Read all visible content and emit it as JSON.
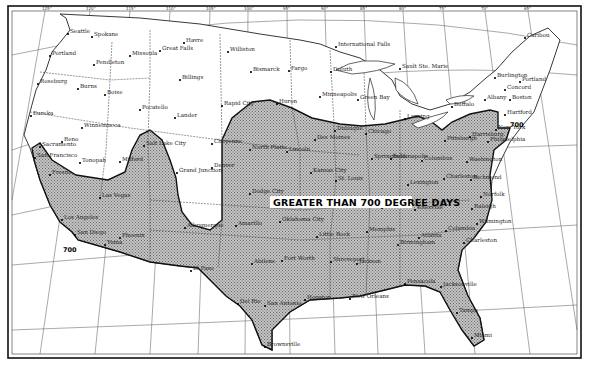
{
  "map": {
    "title_label": "GREATER THAN 700 DEGREE DAYS",
    "isoline_value": "700",
    "isoline_label_west": "700",
    "isoline_label_east": "700",
    "colors": {
      "background": "#ffffff",
      "land_shaded": "#b8b8b8",
      "border": "#111111",
      "graticule": "#444444"
    },
    "longitude_ticks": [
      "125°",
      "120°",
      "115°",
      "110°",
      "105°",
      "100°",
      "95°",
      "90°",
      "85°",
      "80°",
      "75°",
      "70°",
      "65°"
    ],
    "latitude_ticks": [
      "45°",
      "40°",
      "35°",
      "30°",
      "25°"
    ],
    "lakes": [
      "Lake Superior",
      "Lake Michigan",
      "Lake Huron",
      "Lake Erie",
      "Lake Ontario"
    ],
    "cities": [
      {
        "name": "Seattle",
        "x": 68,
        "y": 34
      },
      {
        "name": "Spokane",
        "x": 92,
        "y": 37
      },
      {
        "name": "Portland",
        "x": 50,
        "y": 56
      },
      {
        "name": "Pendleton",
        "x": 94,
        "y": 65
      },
      {
        "name": "Missoula",
        "x": 130,
        "y": 56
      },
      {
        "name": "Great Falls",
        "x": 160,
        "y": 51
      },
      {
        "name": "Havre",
        "x": 184,
        "y": 43
      },
      {
        "name": "Williston",
        "x": 228,
        "y": 52
      },
      {
        "name": "Bismarck",
        "x": 251,
        "y": 72
      },
      {
        "name": "Fargo",
        "x": 289,
        "y": 71
      },
      {
        "name": "International Falls",
        "x": 336,
        "y": 47
      },
      {
        "name": "Duluth",
        "x": 331,
        "y": 72
      },
      {
        "name": "Sault Ste. Marie",
        "x": 400,
        "y": 69
      },
      {
        "name": "Roseburg",
        "x": 38,
        "y": 84
      },
      {
        "name": "Burns",
        "x": 78,
        "y": 89
      },
      {
        "name": "Boise",
        "x": 105,
        "y": 95
      },
      {
        "name": "Billings",
        "x": 180,
        "y": 80
      },
      {
        "name": "Minneapolis",
        "x": 320,
        "y": 97
      },
      {
        "name": "Green Bay",
        "x": 358,
        "y": 100
      },
      {
        "name": "Burlington",
        "x": 495,
        "y": 78
      },
      {
        "name": "Portland",
        "x": 520,
        "y": 82
      },
      {
        "name": "Caribou",
        "x": 525,
        "y": 38
      },
      {
        "name": "Concord",
        "x": 505,
        "y": 90
      },
      {
        "name": "Albany",
        "x": 485,
        "y": 100
      },
      {
        "name": "Boston",
        "x": 510,
        "y": 100
      },
      {
        "name": "Buffalo",
        "x": 452,
        "y": 107
      },
      {
        "name": "Eureka",
        "x": 31,
        "y": 116
      },
      {
        "name": "Winnemucca",
        "x": 82,
        "y": 128
      },
      {
        "name": "Pocatello",
        "x": 140,
        "y": 110
      },
      {
        "name": "Lander",
        "x": 175,
        "y": 118
      },
      {
        "name": "Rapid City",
        "x": 222,
        "y": 106
      },
      {
        "name": "Huron",
        "x": 277,
        "y": 104
      },
      {
        "name": "Lansing",
        "x": 405,
        "y": 119
      },
      {
        "name": "Hartford",
        "x": 505,
        "y": 115
      },
      {
        "name": "New York",
        "x": 496,
        "y": 130
      },
      {
        "name": "Reno",
        "x": 62,
        "y": 142
      },
      {
        "name": "Salt Lake City",
        "x": 144,
        "y": 146
      },
      {
        "name": "Cheyenne",
        "x": 212,
        "y": 144
      },
      {
        "name": "North Platte",
        "x": 250,
        "y": 150
      },
      {
        "name": "Lincoln",
        "x": 287,
        "y": 152
      },
      {
        "name": "Des Moines",
        "x": 315,
        "y": 140
      },
      {
        "name": "Dubuque",
        "x": 335,
        "y": 131
      },
      {
        "name": "Chicago",
        "x": 366,
        "y": 134
      },
      {
        "name": "Pittsburgh",
        "x": 445,
        "y": 141
      },
      {
        "name": "Harrisburg",
        "x": 470,
        "y": 137
      },
      {
        "name": "Philadelphia",
        "x": 488,
        "y": 142
      },
      {
        "name": "Tonopah",
        "x": 80,
        "y": 163
      },
      {
        "name": "Milford",
        "x": 120,
        "y": 162
      },
      {
        "name": "Sacramento",
        "x": 40,
        "y": 147
      },
      {
        "name": "San Francisco",
        "x": 35,
        "y": 158
      },
      {
        "name": "Fresno",
        "x": 50,
        "y": 175
      },
      {
        "name": "Grand Junction",
        "x": 177,
        "y": 173
      },
      {
        "name": "Denver",
        "x": 212,
        "y": 168
      },
      {
        "name": "Springfield",
        "x": 372,
        "y": 159
      },
      {
        "name": "Indianapolis",
        "x": 391,
        "y": 159
      },
      {
        "name": "Columbus",
        "x": 422,
        "y": 161
      },
      {
        "name": "Kansas City",
        "x": 311,
        "y": 173
      },
      {
        "name": "St. Louis",
        "x": 336,
        "y": 181
      },
      {
        "name": "Washington",
        "x": 467,
        "y": 162
      },
      {
        "name": "Lexington",
        "x": 408,
        "y": 185
      },
      {
        "name": "Charleston",
        "x": 444,
        "y": 179
      },
      {
        "name": "Richmond",
        "x": 471,
        "y": 180
      },
      {
        "name": "Las Vegas",
        "x": 100,
        "y": 198
      },
      {
        "name": "Dodge City",
        "x": 250,
        "y": 194
      },
      {
        "name": "Norfolk",
        "x": 481,
        "y": 197
      },
      {
        "name": "Raleigh",
        "x": 472,
        "y": 209
      },
      {
        "name": "Nashville",
        "x": 382,
        "y": 208
      },
      {
        "name": "Knoxville",
        "x": 415,
        "y": 210
      },
      {
        "name": "Los Angeles",
        "x": 62,
        "y": 220
      },
      {
        "name": "San Diego",
        "x": 75,
        "y": 235
      },
      {
        "name": "Yuma",
        "x": 105,
        "y": 245
      },
      {
        "name": "Phoenix",
        "x": 120,
        "y": 238
      },
      {
        "name": "Albuquerque",
        "x": 185,
        "y": 228
      },
      {
        "name": "Amarillo",
        "x": 236,
        "y": 226
      },
      {
        "name": "Oklahoma City",
        "x": 280,
        "y": 222
      },
      {
        "name": "Little Rock",
        "x": 317,
        "y": 237
      },
      {
        "name": "Memphis",
        "x": 367,
        "y": 232
      },
      {
        "name": "Birmingham",
        "x": 398,
        "y": 245
      },
      {
        "name": "Atlanta",
        "x": 419,
        "y": 238
      },
      {
        "name": "Columbia",
        "x": 446,
        "y": 231
      },
      {
        "name": "Wilmington",
        "x": 477,
        "y": 224
      },
      {
        "name": "Charleston",
        "x": 464,
        "y": 243
      },
      {
        "name": "El Paso",
        "x": 191,
        "y": 271
      },
      {
        "name": "Abilene",
        "x": 252,
        "y": 264
      },
      {
        "name": "Fort Worth",
        "x": 282,
        "y": 261
      },
      {
        "name": "Shreveport",
        "x": 331,
        "y": 262
      },
      {
        "name": "Jackson",
        "x": 357,
        "y": 264
      },
      {
        "name": "Pensacola",
        "x": 405,
        "y": 284
      },
      {
        "name": "Jacksonville",
        "x": 441,
        "y": 287
      },
      {
        "name": "Del Rio",
        "x": 238,
        "y": 304
      },
      {
        "name": "San Antonio",
        "x": 265,
        "y": 306
      },
      {
        "name": "Houston",
        "x": 305,
        "y": 300
      },
      {
        "name": "New Orleans",
        "x": 350,
        "y": 299
      },
      {
        "name": "Tampa",
        "x": 457,
        "y": 313
      },
      {
        "name": "Miami",
        "x": 472,
        "y": 338
      },
      {
        "name": "Brownsville",
        "x": 265,
        "y": 347
      }
    ]
  }
}
